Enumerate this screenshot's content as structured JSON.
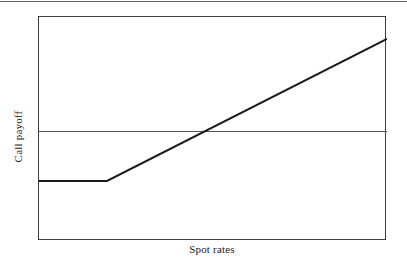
{
  "chart_data": {
    "type": "line",
    "title": "",
    "subtitle": "",
    "xlabel": "Spot rates",
    "ylabel": "Call payoff",
    "grid": false,
    "legend": null,
    "axis_ticks": {
      "x": [],
      "y": []
    },
    "xlim": [
      0,
      100
    ],
    "ylim": [
      0,
      100
    ],
    "annotations": [],
    "series": [
      {
        "name": "Call payoff",
        "type": "line",
        "color": "#1a1a1a",
        "width": 2,
        "description": "Flat at the option premium (negative payoff) until the strike, then rises linearly with the spot rate.",
        "x": [
          0,
          19.54,
          100
        ],
        "y": [
          26.79,
          26.79,
          90.18
        ],
        "points_px": [
          {
            "x": 38,
            "y": 180
          },
          {
            "x": 106,
            "y": 180
          },
          {
            "x": 386,
            "y": 38
          }
        ]
      },
      {
        "name": "zero-line",
        "type": "reference-line",
        "color": "#555555",
        "width": 1,
        "description": "Horizontal break-even reference line at zero payoff.",
        "x": [
          0,
          100
        ],
        "y": [
          49.11,
          49.11
        ],
        "points_px": [
          {
            "x": 38,
            "y": 130
          },
          {
            "x": 386,
            "y": 130
          }
        ]
      }
    ],
    "breakeven_px": {
      "x": 205,
      "y": 130
    },
    "kink_px": {
      "x": 106,
      "y": 180
    }
  },
  "figure": {
    "background_color": "#ffffff",
    "frame_color": "#3c3c3c",
    "line_color": "#1a1a1a",
    "reference_line_color": "#555555"
  }
}
